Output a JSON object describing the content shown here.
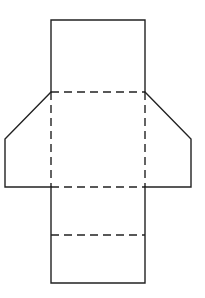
{
  "diagram": {
    "title": "Net of a triangular prism with trapezoidal end faces",
    "stroke_color": "#222222",
    "background": "#ffffff",
    "dash_pattern": [
      8,
      5
    ],
    "points": {
      "top_left": [
        51,
        20
      ],
      "top_right": [
        145,
        20
      ],
      "mid_upper_left": [
        51,
        92
      ],
      "mid_upper_right": [
        145,
        92
      ],
      "left_flap_bend": [
        5,
        139
      ],
      "left_flap_bottom": [
        5,
        187
      ],
      "right_flap_bend": [
        191,
        139
      ],
      "right_flap_bottom": [
        191,
        187
      ],
      "mid_lower_left": [
        51,
        187
      ],
      "mid_lower_right": [
        145,
        187
      ],
      "fold_lower_left": [
        51,
        235
      ],
      "fold_lower_right": [
        145,
        235
      ],
      "bottom_left": [
        51,
        283
      ],
      "bottom_right": [
        145,
        283
      ]
    },
    "solid_edges": [
      {
        "name": "top-face-outline",
        "d": "M51 92 L51 20 L145 20 L145 92"
      },
      {
        "name": "left-flap-outline",
        "d": "M51 92 L5 139 L5 187 L51 187"
      },
      {
        "name": "right-flap-outline",
        "d": "M145 92 L191 139 L191 187 L145 187"
      },
      {
        "name": "bottom-section-outline",
        "d": "M51 187 L51 283 L145 283 L145 187"
      }
    ],
    "fold_lines": [
      {
        "name": "fold-line-upper",
        "x1": 51,
        "y1": 92,
        "x2": 145,
        "y2": 92
      },
      {
        "name": "fold-line-left-vertical",
        "x1": 51,
        "y1": 92,
        "x2": 51,
        "y2": 187
      },
      {
        "name": "fold-line-right-vertical",
        "x1": 145,
        "y1": 92,
        "x2": 145,
        "y2": 187
      },
      {
        "name": "fold-line-middle",
        "x1": 51,
        "y1": 187,
        "x2": 145,
        "y2": 187
      },
      {
        "name": "fold-line-lower",
        "x1": 51,
        "y1": 235,
        "x2": 145,
        "y2": 235
      }
    ]
  }
}
